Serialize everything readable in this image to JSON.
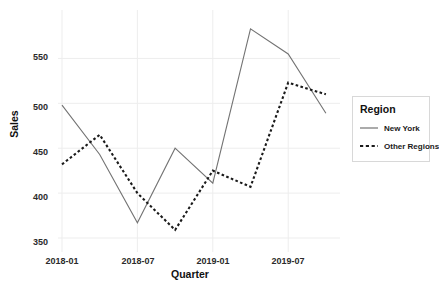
{
  "chart_data": {
    "type": "line",
    "title": "",
    "xlabel": "Quarter",
    "ylabel": "Sales",
    "x": [
      "2018-01",
      "2018-04",
      "2018-07",
      "2018-10",
      "2019-01",
      "2019-04",
      "2019-07",
      "2019-10"
    ],
    "xtick_labels": [
      "2018-01",
      "2018-07",
      "2019-01",
      "2019-07"
    ],
    "xtick_values": [
      "2018-01",
      "2018-07",
      "2019-01",
      "2019-07"
    ],
    "ytick_labels": [
      "350",
      "400",
      "450",
      "500",
      "550"
    ],
    "ytick_values": [
      350,
      400,
      450,
      500,
      550
    ],
    "ylim": [
      340,
      595
    ],
    "xlim": [
      0,
      7.6
    ],
    "grid": true,
    "legend_position": "right",
    "series": [
      {
        "name": "New York",
        "style": "solid",
        "color": "#737373",
        "values": [
          498,
          443,
          367,
          450,
          411,
          583,
          555,
          489
        ]
      },
      {
        "name": "Other Regions",
        "style": "dashed",
        "color": "#1a1a1a",
        "values": [
          432,
          465,
          400,
          359,
          425,
          407,
          523,
          510
        ]
      }
    ],
    "legend": {
      "title": "Region",
      "entries": [
        "New York",
        "Other Regions"
      ]
    }
  },
  "colors": {
    "background": "#ffffff",
    "grid": "#ededed",
    "series_new_york": "#737373",
    "series_other_regions": "#1a1a1a",
    "text": "#1a1a1a",
    "legend_border": "#d8d8d8"
  }
}
